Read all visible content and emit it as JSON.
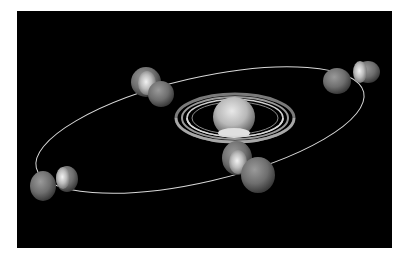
{
  "figure": {
    "background_color": "#000000",
    "orbit_color": "#d8d8d8",
    "planet": {
      "name": "Saturn",
      "center": [
        235,
        122
      ]
    },
    "moon_positions": [
      {
        "id": "top-left",
        "center": [
          152,
          88
        ]
      },
      {
        "id": "top-right",
        "center": [
          347,
          76
        ]
      },
      {
        "id": "bottom-left",
        "center": [
          57,
          183
        ]
      },
      {
        "id": "bottom-right",
        "center": [
          248,
          171
        ]
      }
    ]
  }
}
